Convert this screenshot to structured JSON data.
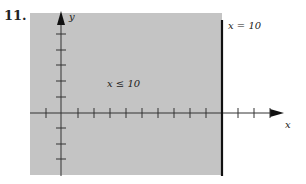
{
  "problem": {
    "number": "11."
  },
  "graph": {
    "region_label": "x ≤ 10",
    "boundary_label": "x = 10",
    "x_axis_label": "x",
    "y_axis_label": "y",
    "shaded_color": "#c4c4c4",
    "axis_color": "#222222",
    "boundary": {
      "x": 10,
      "style": "solid",
      "included": true
    },
    "shaded_side": "left",
    "x_ticks_px": [
      46,
      78,
      94,
      110,
      126,
      142,
      158,
      174,
      190,
      206,
      238,
      254,
      270
    ],
    "y_ticks_px": [
      34,
      50,
      65,
      81,
      97,
      128,
      144,
      159
    ]
  }
}
